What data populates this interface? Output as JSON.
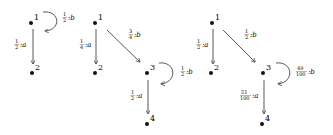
{
  "graphs": [
    {
      "nodes": [
        {
          "id": "1",
          "label": "1"
        },
        {
          "id": "2",
          "label": "2"
        }
      ],
      "edges": [
        {
          "from": "1",
          "to": "1",
          "num": "1",
          "den": "2",
          "symbol": ":b"
        },
        {
          "from": "1",
          "to": "2",
          "num": "1",
          "den": "2",
          "symbol": ":a"
        }
      ]
    },
    {
      "nodes": [
        {
          "id": "1",
          "label": "1"
        },
        {
          "id": "2",
          "label": "2"
        },
        {
          "id": "3",
          "label": "3"
        },
        {
          "id": "4",
          "label": "4"
        }
      ],
      "edges": [
        {
          "from": "1",
          "to": "2",
          "num": "1",
          "den": "4",
          "symbol": ":a"
        },
        {
          "from": "1",
          "to": "3",
          "num": "3",
          "den": "4",
          "symbol": ":b"
        },
        {
          "from": "3",
          "to": "3",
          "num": "1",
          "den": "2",
          "symbol": ":b"
        },
        {
          "from": "3",
          "to": "4",
          "num": "1",
          "den": "2",
          "symbol": ":a"
        }
      ]
    },
    {
      "nodes": [
        {
          "id": "1",
          "label": "1"
        },
        {
          "id": "2",
          "label": "2"
        },
        {
          "id": "3",
          "label": "3"
        },
        {
          "id": "4",
          "label": "4"
        }
      ],
      "edges": [
        {
          "from": "1",
          "to": "2",
          "num": "1",
          "den": "2",
          "symbol": ":a"
        },
        {
          "from": "1",
          "to": "3",
          "num": "1",
          "den": "2",
          "symbol": ":b"
        },
        {
          "from": "3",
          "to": "3",
          "num": "49",
          "den": "100",
          "symbol": ":b"
        },
        {
          "from": "3",
          "to": "4",
          "num": "51",
          "den": "100",
          "symbol": ":a"
        }
      ]
    }
  ]
}
